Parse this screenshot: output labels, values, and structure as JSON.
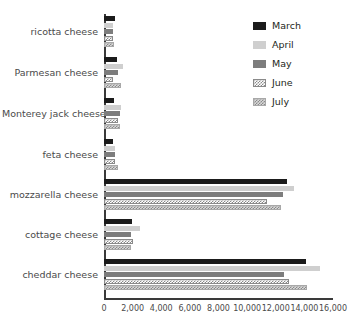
{
  "chart_data": {
    "type": "bar",
    "orientation": "horizontal",
    "title": "",
    "xlabel": "",
    "ylabel": "",
    "xlim": [
      0,
      16000
    ],
    "xticks": [
      0,
      2000,
      4000,
      6000,
      8000,
      10000,
      12000,
      14000,
      16000
    ],
    "xtick_labels": [
      "0",
      "2,000",
      "4,000",
      "6,000",
      "8,000",
      "10,000",
      "12,000",
      "14,000",
      "16,000"
    ],
    "grid": false,
    "legend_position": "top-right",
    "categories": [
      "ricotta cheese",
      "Parmesan cheese",
      "Monterey jack cheese",
      "feta cheese",
      "mozzarella cheese",
      "cottage cheese",
      "cheddar cheese"
    ],
    "series": [
      {
        "name": "March",
        "color": "#1b1b1b",
        "pattern": "solid",
        "values": [
          750,
          900,
          700,
          650,
          12800,
          1950,
          14100
        ]
      },
      {
        "name": "April",
        "color": "#cfcfcf",
        "pattern": "solid",
        "values": [
          600,
          1300,
          1200,
          800,
          13300,
          2500,
          15100
        ]
      },
      {
        "name": "May",
        "color": "#7d7d7d",
        "pattern": "solid",
        "values": [
          600,
          1000,
          1100,
          800,
          12500,
          1900,
          12600
        ]
      },
      {
        "name": "June",
        "color": "#8a8a8a",
        "pattern": "checker-light",
        "values": [
          600,
          600,
          1000,
          750,
          11400,
          2050,
          12900
        ]
      },
      {
        "name": "July",
        "color": "#a8a8a8",
        "pattern": "checker-dark",
        "values": [
          700,
          1200,
          1150,
          1000,
          12400,
          1900,
          14200
        ]
      }
    ]
  },
  "legend": {
    "items": [
      {
        "label": "March",
        "swatch": "sw-march"
      },
      {
        "label": "April",
        "swatch": "sw-april"
      },
      {
        "label": "May",
        "swatch": "sw-may"
      },
      {
        "label": "June",
        "swatch": "sw-june"
      },
      {
        "label": "July",
        "swatch": "sw-july"
      }
    ]
  }
}
